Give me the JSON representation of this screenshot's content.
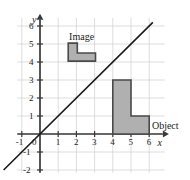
{
  "chart_data": {
    "type": "scatter",
    "title": "",
    "xlabel": "x",
    "ylabel": "y",
    "xlim": [
      -1.3,
      6.9
    ],
    "ylim": [
      -2.2,
      6.6
    ],
    "grid": true,
    "grid_color": "#cfcfcf",
    "axis_color": "#3a3a3a",
    "background": "#ffffff",
    "x_ticks": [
      {
        "value": -1,
        "label": "-1"
      },
      {
        "value": 0,
        "label": "0"
      },
      {
        "value": 1,
        "label": "1"
      },
      {
        "value": 2,
        "label": "2"
      },
      {
        "value": 3,
        "label": "3"
      },
      {
        "value": 4,
        "label": "4"
      },
      {
        "value": 5,
        "label": "5"
      },
      {
        "value": 6,
        "label": "6"
      }
    ],
    "y_ticks": [
      {
        "value": -2,
        "label": "-2"
      },
      {
        "value": -1,
        "label": "-1"
      },
      {
        "value": 1,
        "label": "1"
      },
      {
        "value": 2,
        "label": "2"
      },
      {
        "value": 3,
        "label": "3"
      },
      {
        "value": 4,
        "label": "4"
      },
      {
        "value": 5,
        "label": "5"
      },
      {
        "value": 6,
        "label": "6"
      }
    ],
    "series": [
      {
        "name": "mirror-line",
        "type": "line",
        "equation": "y = x",
        "points": [
          [
            -2,
            -2
          ],
          [
            6.2,
            6.2
          ]
        ],
        "color": "#1a1a1a",
        "width": 1.6
      },
      {
        "name": "Object",
        "type": "polygon",
        "label": "Object",
        "fill": "#b0b0b0",
        "stroke": "#4a4a4a",
        "vertices": [
          [
            4,
            0
          ],
          [
            4,
            3
          ],
          [
            5,
            3
          ],
          [
            5,
            1
          ],
          [
            6,
            1
          ],
          [
            6,
            0
          ]
        ]
      },
      {
        "name": "Image",
        "type": "polygon",
        "label": "Image",
        "fill": "#b0b0b0",
        "stroke": "#4a4a4a",
        "vertices": [
          [
            1.55,
            4.05
          ],
          [
            1.55,
            5.05
          ],
          [
            2.05,
            5.05
          ],
          [
            2.05,
            4.5
          ],
          [
            3.05,
            4.5
          ],
          [
            3.05,
            4.05
          ]
        ]
      }
    ],
    "annotations": [
      {
        "name": "image-label",
        "text": "Image",
        "x": 1.6,
        "y": 5.65
      },
      {
        "name": "object-label",
        "text": "Object",
        "x": 6.15,
        "y": 0.72
      }
    ]
  },
  "axis_names": {
    "x": "x",
    "y": "y"
  },
  "origin_label": "0"
}
